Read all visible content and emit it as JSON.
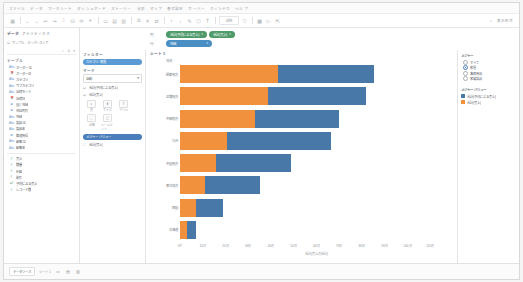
{
  "window": {
    "title": "Tableau Desktop"
  },
  "menubar": {
    "items": [
      {
        "label": "ファイル"
      },
      {
        "label": "データ"
      },
      {
        "label": "ワークシート"
      },
      {
        "label": "ダッシュボード"
      },
      {
        "label": "ストーリー"
      },
      {
        "label": "分析"
      },
      {
        "label": "マップ"
      },
      {
        "label": "書式設定"
      },
      {
        "label": "サーバー"
      },
      {
        "label": "ウィンドウ"
      },
      {
        "label": "ヘルプ"
      }
    ]
  },
  "toolbar": {
    "icons": [
      {
        "name": "tableau-logo-icon",
        "glyph": "▦"
      },
      {
        "name": "back-icon",
        "glyph": "←"
      },
      {
        "name": "forward-icon",
        "glyph": "→"
      },
      {
        "name": "undo-icon",
        "glyph": "↩"
      },
      {
        "name": "redo-icon",
        "glyph": "↪"
      },
      {
        "name": "save-icon",
        "glyph": "⌷"
      },
      {
        "name": "new-data-source-icon",
        "glyph": "⛁"
      },
      {
        "name": "refresh-data-icon",
        "glyph": "⟳"
      },
      {
        "name": "pause-query-icon",
        "glyph": "⏸"
      },
      {
        "name": "new-worksheet-icon",
        "glyph": "▭"
      },
      {
        "name": "new-dashboard-icon",
        "glyph": "▤"
      },
      {
        "name": "new-story-icon",
        "glyph": "▥"
      },
      {
        "name": "duplicate-icon",
        "glyph": "⧉"
      },
      {
        "name": "clear-sheet-icon",
        "glyph": "✕"
      },
      {
        "name": "swap-rows-columns-icon",
        "glyph": "⇄"
      },
      {
        "name": "sort-ascending-icon",
        "glyph": "↑"
      },
      {
        "name": "sort-descending-icon",
        "glyph": "↓"
      },
      {
        "name": "highlight-icon",
        "glyph": "✎"
      },
      {
        "name": "group-members-icon",
        "glyph": "⬡"
      },
      {
        "name": "show-labels-icon",
        "glyph": "T"
      },
      {
        "name": "presentation-mode-icon",
        "glyph": "▷"
      },
      {
        "name": "show-me-icon",
        "glyph": "▩"
      },
      {
        "name": "fit-dropdown-icon",
        "glyph": "▽"
      },
      {
        "name": "fix-axes-icon",
        "glyph": "⇱"
      }
    ],
    "fit_label": "標準",
    "show_me_label": "表示形式"
  },
  "data_pane": {
    "tab_data_label": "データ",
    "tab_analytics_label": "アナリティクス",
    "datasource_name": "サンプル - スーパーストア",
    "search_placeholder": "検索",
    "dimensions_title": "テーブル",
    "fields": [
      {
        "label": "オーダー ID",
        "type": "dimension",
        "icon": "abc-icon"
      },
      {
        "label": "オーダー日",
        "type": "dimension",
        "icon": "date-icon"
      },
      {
        "label": "カテゴリ",
        "type": "dimension",
        "icon": "abc-icon"
      },
      {
        "label": "サブカテゴリ",
        "type": "dimension",
        "icon": "abc-icon"
      },
      {
        "label": "出荷モード",
        "type": "dimension",
        "icon": "abc-icon"
      },
      {
        "label": "出荷日",
        "type": "dimension",
        "icon": "date-icon"
      },
      {
        "label": "国 / 地域",
        "type": "dimension",
        "icon": "geo-icon"
      },
      {
        "label": "市区町村",
        "type": "dimension",
        "icon": "geo-icon"
      },
      {
        "label": "地域",
        "type": "dimension",
        "icon": "abc-icon"
      },
      {
        "label": "製品 ID",
        "type": "dimension",
        "icon": "abc-icon"
      },
      {
        "label": "製品名",
        "type": "dimension",
        "icon": "abc-icon"
      },
      {
        "label": "都道府県",
        "type": "dimension",
        "icon": "geo-icon"
      },
      {
        "label": "顧客 ID",
        "type": "dimension",
        "icon": "abc-icon"
      },
      {
        "label": "顧客名",
        "type": "dimension",
        "icon": "abc-icon"
      },
      {
        "label": "売上",
        "type": "measure",
        "icon": "number-icon"
      },
      {
        "label": "数量",
        "type": "measure",
        "icon": "number-icon"
      },
      {
        "label": "利益",
        "type": "measure",
        "icon": "number-icon"
      },
      {
        "label": "割引",
        "type": "measure",
        "icon": "number-icon"
      },
      {
        "label": "予測による売上",
        "type": "measure",
        "icon": "calc-icon"
      },
      {
        "label": "レコード数",
        "type": "measure",
        "icon": "number-icon"
      }
    ]
  },
  "cards": {
    "filters_title": "フィルター",
    "filter_pills": [
      {
        "label": "カテゴリ: 家具"
      }
    ],
    "marks_title": "マーク",
    "mark_type": "自動",
    "measure_values_label": "メジャー バリュー",
    "mark_rows": [
      {
        "label": "合計(予測による売上)"
      },
      {
        "label": "合計(売上)"
      }
    ],
    "buttons": [
      {
        "name": "color-button",
        "label": "色",
        "glyph": "◐"
      },
      {
        "name": "size-button",
        "label": "サイズ",
        "glyph": "⬍"
      },
      {
        "name": "label-button",
        "label": "ラベル",
        "glyph": "T"
      },
      {
        "name": "detail-button",
        "label": "詳細",
        "glyph": "⬚"
      },
      {
        "name": "tooltip-button",
        "label": "ツールヒント",
        "glyph": "▢"
      }
    ]
  },
  "shelves": {
    "columns_label": "列",
    "rows_label": "行",
    "columns_pills": [
      {
        "label": "合計(予測による売上)"
      },
      {
        "label": "合計(売上)"
      }
    ],
    "rows_pills": [
      {
        "label": "地域"
      }
    ]
  },
  "legend": {
    "measure_title": "メジャー",
    "measure_options": [
      {
        "label": "すべて",
        "selected": false
      },
      {
        "label": "家具",
        "selected": true
      },
      {
        "label": "事務用品",
        "selected": false
      },
      {
        "label": "家電製品",
        "selected": false
      }
    ],
    "values_title": "メジャー バリュー",
    "entries": [
      {
        "label": "合計(予測による売上)",
        "color": "#4878a8"
      },
      {
        "label": "合計(売上)",
        "color": "#f2913d"
      }
    ]
  },
  "sheet": {
    "title": "シート 1",
    "row_header_title": "地域"
  },
  "statusbar": {
    "tabs": [
      {
        "label": "データソース"
      }
    ],
    "sheet_tab": "シート 1",
    "add_icons": [
      {
        "name": "new-worksheet-icon",
        "glyph": "▭"
      },
      {
        "name": "new-dashboard-icon",
        "glyph": "▤"
      },
      {
        "name": "new-story-icon",
        "glyph": "▥"
      }
    ]
  },
  "chart_data": {
    "type": "bar",
    "orientation": "horizontal",
    "stacked": true,
    "title": "シート 1",
    "xlabel": "合計(売上の合計)",
    "ylabel": "地域",
    "xlim": [
      0,
      1200000
    ],
    "grid": false,
    "legend_position": "right",
    "categories": [
      "関東地方",
      "近畿地方",
      "中部地方",
      "九州",
      "中国地方",
      "東北地方",
      "四国",
      "北海道"
    ],
    "tick_labels": [
      "0千",
      "10万",
      "20万",
      "30万",
      "40万",
      "50万",
      "60万",
      "70万",
      "80万",
      "90万",
      "100万",
      "110万"
    ],
    "tick_values": [
      0,
      100000,
      200000,
      300000,
      400000,
      500000,
      600000,
      700000,
      800000,
      900000,
      1000000,
      1100000
    ],
    "series": [
      {
        "name": "合計(売上)",
        "color": "#f2913d",
        "values": [
          432000,
          388000,
          330000,
          205000,
          160000,
          110000,
          72000,
          30000
        ]
      },
      {
        "name": "合計(予測による売上)",
        "color": "#4878a8",
        "values": [
          420000,
          430000,
          370000,
          460000,
          330000,
          240000,
          115000,
          40000
        ]
      }
    ]
  }
}
